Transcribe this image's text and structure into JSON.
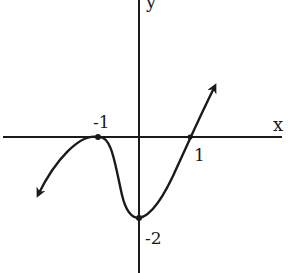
{
  "figure": {
    "type": "function-graph",
    "axes": {
      "x_label": "x",
      "y_label": "y"
    },
    "annotations": {
      "x_tick_neg1": "-1",
      "x_tick_1": "1",
      "y_tick_neg2": "-2"
    },
    "key_points": [
      {
        "x": -1,
        "y": 0,
        "kind": "local maximum / touches x-axis"
      },
      {
        "x": 0,
        "y": -2,
        "kind": "local minimum / y-intercept"
      },
      {
        "x": 1,
        "y": 0,
        "kind": "x-intercept (crosses)"
      }
    ],
    "end_behavior": {
      "left": "decreasing toward -infinity (arrow down-left)",
      "right": "increasing toward +infinity (arrow up-right)"
    },
    "colors": {
      "stroke": "#1a1a1a",
      "background": "#ffffff"
    }
  }
}
